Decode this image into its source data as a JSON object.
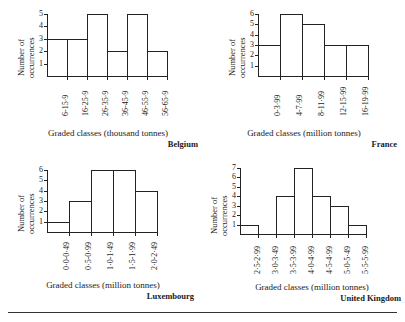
{
  "figure": {
    "axis_label_line1": "Number of",
    "axis_label_line2": "occurrences",
    "divider": "horizontal-rule"
  },
  "chart_data": [
    {
      "type": "bar",
      "title": "Belgium",
      "xlabel": "Graded classes  (thousand tonnes)",
      "ylabel": "Number of occurrences",
      "categories": [
        "6-15·9",
        "16-25·9",
        "26-35·9",
        "36-45·9",
        "46-55·9",
        "56-65·9"
      ],
      "values": [
        3,
        3,
        5,
        2,
        5,
        2
      ],
      "yticks": [
        1,
        2,
        3,
        4,
        5
      ],
      "ylim": [
        0,
        5
      ],
      "grid": false,
      "legend": "none"
    },
    {
      "type": "bar",
      "title": "France",
      "xlabel": "Graded classes (million tonnes)",
      "ylabel": "Number of occurrences",
      "categories": [
        "0-3·99",
        "4-7·99",
        "8-11·99",
        "12-15·99",
        "16-19·99"
      ],
      "values": [
        3,
        6,
        5,
        3,
        3
      ],
      "yticks": [
        1,
        2,
        3,
        4,
        5,
        6
      ],
      "ylim": [
        0,
        6
      ],
      "grid": false,
      "legend": "none"
    },
    {
      "type": "bar",
      "title": "Luxembourg",
      "xlabel": "Graded classes (million tonnes)",
      "ylabel": "Number of occurrences",
      "categories": [
        "0·0-0·49",
        "0·5-0·99",
        "1·0-1·49",
        "1·5-1·99",
        "2·0-2·49"
      ],
      "values": [
        1,
        3,
        6,
        6,
        4
      ],
      "yticks": [
        1,
        2,
        3,
        4,
        5,
        6
      ],
      "ylim": [
        0,
        6
      ],
      "grid": false,
      "legend": "none"
    },
    {
      "type": "bar",
      "title": "United Kingdom",
      "xlabel": "Graded classes  (million tonnes)",
      "ylabel": "Number of occurrences",
      "categories": [
        "2·5-2·99",
        "3·0-3·49",
        "3·5-3·99",
        "4·0-4·99",
        "4·5-4·99",
        "5·0-5·49",
        "5·5-5·99"
      ],
      "values": [
        1,
        0,
        4,
        7,
        4,
        3,
        1
      ],
      "yticks": [
        1,
        2,
        3,
        4,
        5,
        6,
        7
      ],
      "ylim": [
        0,
        7
      ],
      "grid": false,
      "legend": "none"
    }
  ]
}
